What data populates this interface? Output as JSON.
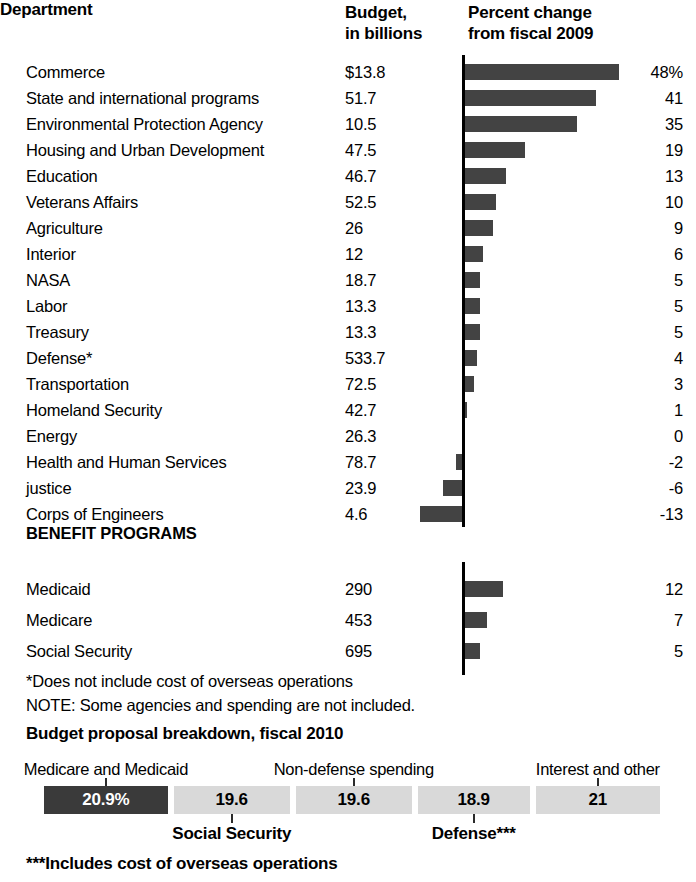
{
  "headers": {
    "department": "Department",
    "budget": "Budget,\nin billions",
    "budget_line1": "Budget,",
    "budget_line2": "in billions",
    "percent_line1": "Percent change",
    "percent_line2": "from fiscal 2009"
  },
  "section_heading": "BENEFIT PROGRAMS",
  "notes": {
    "asterisk": "*Does not include cost of overseas operations",
    "note": "NOTE: Some agencies and spending are not included.",
    "breakdown_title": "Budget proposal breakdown, fiscal 2010",
    "triple_asterisk": "***Includes cost of overseas operations"
  },
  "colors": {
    "bar": "#434343",
    "axis": "#000000",
    "segment_dark": "#3a3a3a",
    "segment_light": "#d9d9d9",
    "text": "#000000"
  },
  "chart_data": {
    "type": "bar",
    "title": "Percent change from fiscal 2009",
    "xlabel": "Percent change from fiscal 2009",
    "ylabel": "Department",
    "orientation": "horizontal",
    "grid": false,
    "legend": null,
    "xlim": [
      -13,
      48
    ],
    "zero_line": true,
    "columns": [
      "Department",
      "Budget, in billions",
      "Percent change from fiscal 2009"
    ],
    "categories": [
      "Commerce",
      "State and international programs",
      "Environmental Protection Agency",
      "Housing and Urban Development",
      "Education",
      "Veterans Affairs",
      "Agriculture",
      "Interior",
      "NASA",
      "Labor",
      "Treasury",
      "Defense*",
      "Transportation",
      "Homeland Security",
      "Energy",
      "Health and Human Services",
      "justice",
      "Corps of Engineers"
    ],
    "values": [
      48,
      41,
      35,
      19,
      13,
      10,
      9,
      6,
      5,
      5,
      5,
      4,
      3,
      1,
      0,
      -2,
      -6,
      -13
    ],
    "budgets": [
      "$13.8",
      "51.7",
      "10.5",
      "47.5",
      "46.7",
      "52.5",
      "26",
      "12",
      "18.7",
      "13.3",
      "13.3",
      "533.7",
      "72.5",
      "42.7",
      "26.3",
      "78.7",
      "23.9",
      "4.6"
    ],
    "percent_labels": [
      "48%",
      "41",
      "35",
      "19",
      "13",
      "10",
      "9",
      "6",
      "5",
      "5",
      "5",
      "4",
      "3",
      "1",
      "0",
      "-2",
      "-6",
      "-13"
    ],
    "benefit_programs": {
      "heading": "BENEFIT PROGRAMS",
      "categories": [
        "Medicaid",
        "Medicare",
        "Social Security"
      ],
      "values": [
        12,
        7,
        5
      ],
      "budgets": [
        "290",
        "453",
        "695"
      ],
      "percent_labels": [
        "12",
        "7",
        "5"
      ]
    }
  },
  "breakdown": {
    "title": "Budget proposal breakdown, fiscal 2010",
    "type": "stacked-bar",
    "unit": "percent",
    "segments": [
      {
        "label": "Medicare and Medicaid",
        "value": "20.9%",
        "numeric": 20.9,
        "label_position": "above",
        "style": "dark"
      },
      {
        "label": "Social Security",
        "value": "19.6",
        "numeric": 19.6,
        "label_position": "below",
        "style": "light"
      },
      {
        "label": "Non-defense spending",
        "value": "19.6",
        "numeric": 19.6,
        "label_position": "above",
        "style": "light"
      },
      {
        "label": "Defense***",
        "value": "18.9",
        "numeric": 18.9,
        "label_position": "below",
        "style": "light"
      },
      {
        "label": "Interest and other",
        "value": "21",
        "numeric": 21,
        "label_position": "above",
        "style": "light"
      }
    ]
  }
}
